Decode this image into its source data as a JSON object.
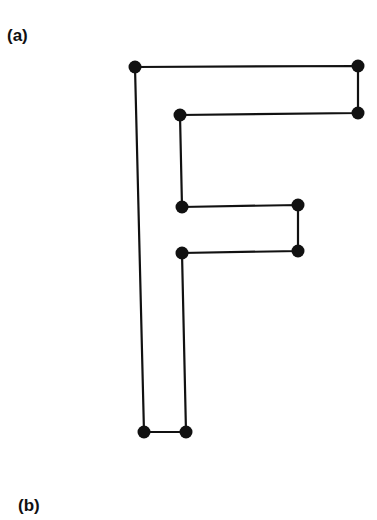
{
  "panels": [
    {
      "label": "(a)"
    },
    {
      "label": "(b)"
    }
  ],
  "diagram": {
    "stroke_color": "#111111",
    "node_color": "#111111",
    "node_radius": 6.5,
    "vertices": [
      [
        135,
        67
      ],
      [
        358,
        66
      ],
      [
        358,
        113
      ],
      [
        180,
        115
      ],
      [
        182,
        207
      ],
      [
        298,
        205
      ],
      [
        298,
        251
      ],
      [
        182,
        253
      ],
      [
        186,
        432
      ],
      [
        144,
        432
      ]
    ]
  }
}
